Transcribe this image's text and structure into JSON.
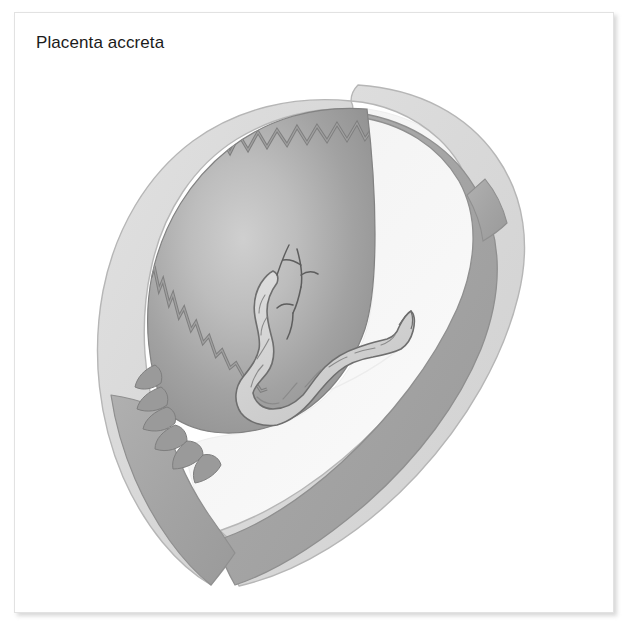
{
  "figure": {
    "title": "Placenta accreta",
    "background_color": "#ffffff",
    "frame_border_color": "#e2e2e2",
    "shadow_color": "#aaaaaa"
  },
  "illustration": {
    "kind": "medical-cross-section-diagram",
    "subject": "placenta accreta",
    "description": "Sagittal cross-section of the gravid uterus showing the placenta with chorionic villi invading the myometrium, and the umbilical cord arising from the placental surface into the amniotic cavity.",
    "structures": [
      {
        "name": "myometrium",
        "label": "uterine wall (myometrium)",
        "fill": "#dcdcdc",
        "stroke": "#b4b4b4"
      },
      {
        "name": "decidua-band",
        "label": "decidua / inner uterine layer",
        "fill": "#a8a8a8",
        "stroke": "#8e8e8e"
      },
      {
        "name": "placenta",
        "label": "placenta",
        "fill_dark": "#8f8f8f",
        "fill_light": "#c4c4c4",
        "stroke": "#7e7e7e"
      },
      {
        "name": "chorionic-villi",
        "label": "chorionic villi invading myometrium",
        "fill": "#949494",
        "stroke": "#7a7a7a"
      },
      {
        "name": "amniotic-cavity",
        "label": "amniotic cavity",
        "fill": "#f5f5f5",
        "stroke": "#ececec"
      },
      {
        "name": "umbilical-cord",
        "label": "umbilical cord",
        "fill": "#d2d2d2",
        "stroke": "#6f6f6f"
      },
      {
        "name": "chorionic-vessels",
        "label": "chorionic plate vessels",
        "stroke": "#5e5e5e"
      }
    ],
    "colors": {
      "outer_wall": "#dcdcdc",
      "outer_wall_edge": "#b4b4b4",
      "decidua": "#a8a8a8",
      "placenta_edge": "#8a8a8a",
      "placenta_center": "#c6c6c6",
      "cavity": "#f4f4f4",
      "cord_fill": "#d4d4d4",
      "cord_outline": "#6f6f6f",
      "title_text": "#1b1b1b"
    }
  }
}
